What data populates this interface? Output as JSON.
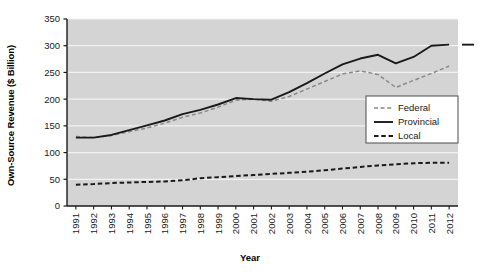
{
  "chart_data": {
    "type": "line",
    "title": "",
    "xlabel": "Year",
    "ylabel": "Own-Source Revenue ($ Billion)",
    "ylim": [
      0,
      350
    ],
    "yticks": [
      0,
      50,
      100,
      150,
      200,
      250,
      300,
      350
    ],
    "grid": true,
    "legend_position": "lower-right-inside",
    "categories": [
      "1991",
      "1992",
      "1993",
      "1994",
      "1995",
      "1996",
      "1997",
      "1998",
      "1999",
      "2000",
      "2001",
      "2002",
      "2003",
      "2004",
      "2005",
      "2006",
      "2007",
      "2008",
      "2009",
      "2010",
      "2011",
      "2012"
    ],
    "x": [
      1991,
      1992,
      1993,
      1994,
      1995,
      1996,
      1997,
      1998,
      1999,
      2000,
      2001,
      2002,
      2003,
      2004,
      2005,
      2006,
      2007,
      2008,
      2009,
      2010,
      2011,
      2012
    ],
    "series": [
      {
        "name": "Federal",
        "style": "dashed-light",
        "color": "#8a8a8a",
        "values": [
          130,
          128,
          132,
          139,
          146,
          155,
          166,
          174,
          185,
          198,
          200,
          196,
          205,
          219,
          233,
          247,
          253,
          246,
          222,
          235,
          248,
          262
        ]
      },
      {
        "name": "Provincial",
        "style": "solid",
        "color": "#1a1a1a",
        "values": [
          128,
          128,
          133,
          142,
          151,
          160,
          172,
          180,
          190,
          202,
          200,
          199,
          213,
          230,
          248,
          265,
          276,
          283,
          267,
          279,
          300,
          302
        ]
      },
      {
        "name": "Local",
        "style": "dashed-heavy",
        "color": "#1a1a1a",
        "values": [
          40,
          41,
          43,
          44,
          45,
          46,
          48,
          52,
          54,
          56,
          58,
          60,
          62,
          64,
          67,
          70,
          73,
          76,
          78,
          80,
          81,
          81
        ]
      }
    ]
  },
  "legend": {
    "items": [
      {
        "label": "Federal"
      },
      {
        "label": "Provincial"
      },
      {
        "label": "Local"
      }
    ]
  },
  "axes": {
    "y_tick_labels": [
      "350",
      "300",
      "250",
      "200",
      "150",
      "100",
      "50",
      "0"
    ],
    "x_tick_labels": [
      "1991",
      "1992",
      "1993",
      "1994",
      "1995",
      "1996",
      "1997",
      "1998",
      "1999",
      "2000",
      "2001",
      "2002",
      "2003",
      "2004",
      "2005",
      "2006",
      "2007",
      "2008",
      "2009",
      "2010",
      "2011",
      "2012"
    ],
    "y_axis_title": "Own-Source Revenue ($ Billion)",
    "x_axis_title": "Year"
  },
  "colors": {
    "plot_background": "#d4d4d4",
    "grid": "#f2f2f2",
    "axis": "#1a1a1a",
    "federal": "#8a8a8a",
    "provincial": "#1a1a1a",
    "local": "#1a1a1a",
    "page_background": "#ffffff"
  }
}
